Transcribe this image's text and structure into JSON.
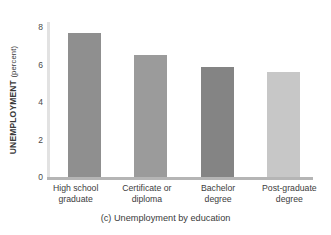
{
  "chart_data": {
    "type": "bar",
    "title": "",
    "caption": "(c) Unemployment by education",
    "xlabel": "",
    "ylabel": "UNEMPLOYMENT",
    "ylabel_unit": "(percent)",
    "categories": [
      "High school graduate",
      "Certificate or diploma",
      "Bachelor degree",
      "Post-graduate degree"
    ],
    "category_lines": [
      [
        "High school",
        "graduate"
      ],
      [
        "Certificate or",
        "diploma"
      ],
      [
        "Bachelor",
        "degree"
      ],
      [
        "Post-graduate",
        "degree"
      ]
    ],
    "values": [
      7.7,
      6.5,
      5.9,
      5.6
    ],
    "ylim": [
      0,
      8.5
    ],
    "yticks": [
      0,
      2,
      4,
      6,
      8
    ],
    "ytick_labels": [
      "0",
      "2",
      "4",
      "6",
      "8"
    ],
    "grid": false,
    "legend": "none",
    "bar_colors": [
      "#8f8f8f",
      "#9b9b9b",
      "#848484",
      "#c7c7c7"
    ],
    "axis_color": "#b5b5b5",
    "yaxis_color": "#e2e2e2"
  }
}
